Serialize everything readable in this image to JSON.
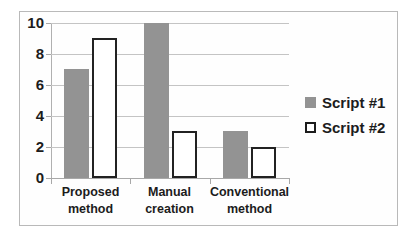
{
  "chart_data": {
    "type": "bar",
    "title": "",
    "xlabel": "",
    "ylabel": "",
    "categories": [
      "Proposed\nmethod",
      "Manual\ncreation",
      "Conventional\nmethod"
    ],
    "series": [
      {
        "name": "Script #1",
        "values": [
          7,
          10,
          3
        ],
        "color": "#939393",
        "style": "filled"
      },
      {
        "name": "Script #2",
        "values": [
          9,
          3,
          2
        ],
        "color": "#ffffff",
        "style": "outlined"
      }
    ],
    "ylim": [
      0,
      10
    ],
    "yticks": [
      0,
      2,
      4,
      6,
      8,
      10
    ],
    "ytick_labels": [
      "0",
      "2",
      "4",
      "6",
      "8",
      "10"
    ],
    "grid": true,
    "grid_axis": "y",
    "legend_position": "right"
  },
  "legend": {
    "entries": [
      {
        "label": "Script #1",
        "marker": "filled-square-gray"
      },
      {
        "label": "Script #2",
        "marker": "outlined-square-white"
      }
    ]
  },
  "colors": {
    "series1": "#939393",
    "series2": "#ffffff",
    "outline": "#222222",
    "gridline": "#c4c4c4",
    "axis": "#a8a8a8",
    "frame": "#b9b9b9",
    "text": "#1c1c1c",
    "background": "#fefefe"
  }
}
